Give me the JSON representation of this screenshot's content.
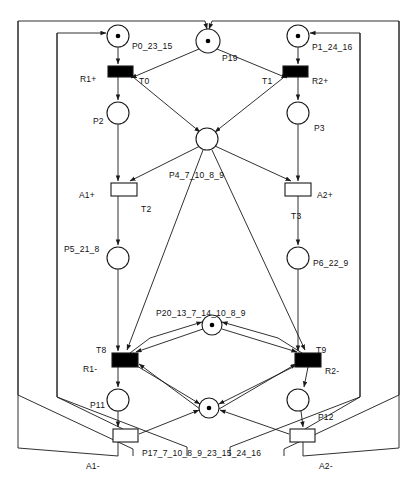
{
  "diagram": {
    "type": "petri-net",
    "canvas": {
      "width": 416,
      "height": 481
    },
    "colors": {
      "stroke": "#1a1a1a",
      "background": "#ffffff",
      "transition_enabled_fill": "#000000",
      "transition_disabled_fill": "#ffffff",
      "token_fill": "#000000"
    }
  },
  "places": [
    {
      "id": "P0",
      "label": "P0_23_15",
      "cx": 118,
      "cy": 36,
      "r": 11,
      "tokens": 1,
      "label_x": 132,
      "label_y": 41
    },
    {
      "id": "P19",
      "label": "P19",
      "cx": 208,
      "cy": 41,
      "r": 12,
      "tokens": 1,
      "label_x": 222,
      "label_y": 53
    },
    {
      "id": "P1",
      "label": "P1_24_16",
      "cx": 298,
      "cy": 36,
      "r": 11,
      "tokens": 1,
      "label_x": 312,
      "label_y": 42
    },
    {
      "id": "P2",
      "label": "P2",
      "cx": 118,
      "cy": 113,
      "r": 11,
      "tokens": 0,
      "label_x": 93,
      "label_y": 116
    },
    {
      "id": "P3",
      "label": "P3",
      "cx": 298,
      "cy": 113,
      "r": 11,
      "tokens": 0,
      "label_x": 314,
      "label_y": 123
    },
    {
      "id": "P4",
      "label": "P4_7_10_8_9",
      "cx": 207,
      "cy": 139,
      "r": 11,
      "tokens": 0,
      "label_x": 169,
      "label_y": 170
    },
    {
      "id": "P5",
      "label": "P5_21_8",
      "cx": 118,
      "cy": 258,
      "r": 11,
      "tokens": 0,
      "label_x": 64,
      "label_y": 244
    },
    {
      "id": "P6",
      "label": "P6_22_9",
      "cx": 298,
      "cy": 258,
      "r": 11,
      "tokens": 0,
      "label_x": 313,
      "label_y": 258
    },
    {
      "id": "P20",
      "label": "P20_13_7_14_10_8_9",
      "cx": 212,
      "cy": 325,
      "r": 10,
      "tokens": 1,
      "label_x": 156,
      "label_y": 308
    },
    {
      "id": "P11",
      "label": "P11",
      "cx": 118,
      "cy": 400,
      "r": 11,
      "tokens": 0,
      "label_x": 90,
      "label_y": 400
    },
    {
      "id": "P12",
      "label": "P12",
      "cx": 298,
      "cy": 400,
      "r": 11,
      "tokens": 0,
      "label_x": 318,
      "label_y": 412
    },
    {
      "id": "P17",
      "label": "P17_7_10_8_9_23_15_24_16",
      "cx": 209,
      "cy": 408,
      "r": 10,
      "tokens": 1,
      "label_x": 142,
      "label_y": 448
    }
  ],
  "transitions": [
    {
      "id": "T0",
      "name_label": "T0",
      "action_label": "R1+",
      "x": 108,
      "y": 66,
      "w": 25,
      "h": 11,
      "filled": true,
      "name_x": 139,
      "name_y": 76,
      "action_x": 80,
      "action_y": 74
    },
    {
      "id": "T1",
      "name_label": "T1",
      "action_label": "R2+",
      "x": 283,
      "y": 66,
      "w": 25,
      "h": 11,
      "filled": true,
      "name_x": 262,
      "name_y": 76,
      "action_x": 312,
      "action_y": 76
    },
    {
      "id": "T2",
      "name_label": "T2",
      "action_label": "A1+",
      "x": 111,
      "y": 183,
      "w": 26,
      "h": 13,
      "filled": false,
      "name_x": 141,
      "name_y": 204,
      "action_x": 79,
      "action_y": 190
    },
    {
      "id": "T3",
      "name_label": "T3",
      "action_label": "A2+",
      "x": 285,
      "y": 183,
      "w": 26,
      "h": 13,
      "filled": false,
      "name_x": 291,
      "name_y": 211,
      "action_x": 317,
      "action_y": 190
    },
    {
      "id": "T8",
      "name_label": "T8",
      "action_label": "R1-",
      "x": 112,
      "y": 353,
      "w": 26,
      "h": 14,
      "filled": true,
      "name_x": 96,
      "name_y": 345,
      "action_x": 83,
      "action_y": 364
    },
    {
      "id": "T9",
      "name_label": "T9",
      "action_label": "R2-",
      "x": 295,
      "y": 353,
      "w": 26,
      "h": 14,
      "filled": true,
      "name_x": 316,
      "name_y": 345,
      "action_x": 325,
      "action_y": 366
    },
    {
      "id": "TA1m",
      "name_label": "A1-",
      "action_label": "",
      "x": 113,
      "y": 429,
      "w": 25,
      "h": 13,
      "filled": false,
      "name_x": 86,
      "name_y": 461,
      "action_x": 0,
      "action_y": 0
    },
    {
      "id": "TA2m",
      "name_label": "A2-",
      "action_label": "",
      "x": 290,
      "y": 429,
      "w": 25,
      "h": 13,
      "filled": false,
      "name_x": 319,
      "name_y": 461,
      "action_x": 0,
      "action_y": 0
    }
  ],
  "arcs": [
    {
      "from": "P0",
      "to": "T0",
      "path": "M118,47 L118,64"
    },
    {
      "from": "T0",
      "to": "P2",
      "path": "M118,77 L118,100"
    },
    {
      "from": "P2",
      "to": "T2",
      "path": "M118,124 L118,181"
    },
    {
      "from": "T2",
      "to": "P5",
      "path": "M118,196 L118,245"
    },
    {
      "from": "P5",
      "to": "T8",
      "path": "M118,269 L118,351"
    },
    {
      "from": "T8",
      "to": "P11",
      "path": "M118,367 L118,387"
    },
    {
      "from": "P11",
      "to": "TA1m",
      "path": "M118,411 L118,427"
    },
    {
      "from": "P1",
      "to": "T1",
      "path": "M298,47 L298,64"
    },
    {
      "from": "T1",
      "to": "P3",
      "path": "M298,77 L298,100"
    },
    {
      "from": "P3",
      "to": "T3",
      "path": "M298,124 L298,181"
    },
    {
      "from": "T3",
      "to": "P6",
      "path": "M298,196 L298,245"
    },
    {
      "from": "P6",
      "to": "T9",
      "path": "M298,269 L298,351"
    },
    {
      "from": "T9",
      "to": "P12",
      "path": "M308,367 L304,387"
    },
    {
      "from": "P12",
      "to": "TA2m",
      "path": "M301,411 L303,427"
    },
    {
      "from": "P19",
      "to": "T0",
      "path": "M199,49 L131,78"
    },
    {
      "from": "P19",
      "to": "T1",
      "path": "M217,49 L287,78"
    },
    {
      "from": "T0",
      "to": "P4",
      "path": "M133,77 L200,132"
    },
    {
      "from": "T1",
      "to": "P4",
      "path": "M283,78 L215,132"
    },
    {
      "from": "P4",
      "to": "T2",
      "path": "M200,146 L130,181"
    },
    {
      "from": "P4",
      "to": "T3",
      "path": "M215,146 L291,181"
    },
    {
      "from": "P4",
      "to": "T8",
      "path": "M203,150 L127,350"
    },
    {
      "from": "P4",
      "to": "T9",
      "path": "M212,150 L305,350"
    },
    {
      "from": "P20",
      "to": "T8",
      "path": "M203,329 L136,352"
    },
    {
      "from": "P20",
      "to": "T9",
      "path": "M222,329 L297,352"
    },
    {
      "from": "T8",
      "to": "P20",
      "path": "M130,353 L150,338 L202,322"
    },
    {
      "from": "T9",
      "to": "P20",
      "path": "M302,353 L278,338 L222,322"
    },
    {
      "from": "T8",
      "to": "P17",
      "path": "M137,366 L200,404"
    },
    {
      "from": "P17",
      "to": "T8",
      "path": "M200,409 L139,364"
    },
    {
      "from": "T9",
      "to": "P17",
      "path": "M295,366 L219,404"
    },
    {
      "from": "P17",
      "to": "T9",
      "path": "M219,409 L296,364"
    },
    {
      "from": "TA1m",
      "to": "P17",
      "path": "M139,434 L199,410"
    },
    {
      "from": "TA2m",
      "to": "P17",
      "path": "M289,434 L220,410"
    },
    {
      "from": "TA1m",
      "to": "P0",
      "path": "M118,442 L118,456 L18,448 L18,21 L205,21 L207,29"
    },
    {
      "from": "TA1m",
      "to": "P19",
      "path": "M123,429 L57,397 L57,33 L106,33"
    },
    {
      "from": "TA2m",
      "to": "P1",
      "path": "M303,442 L303,456 L399,448 L399,21 L212,21 L209,29"
    },
    {
      "from": "TA2m",
      "to": "P19",
      "path": "M305,429 L360,397 L360,33 L310,33"
    }
  ],
  "boundary_loops": {
    "left_outer": "M18,21 L18,395 L133,449 L133,456",
    "left_inner": "M57,33 L57,397 L187,447 L187,456",
    "right_outer": "M399,21 L399,395 L284,449 L284,456",
    "right_inner": "M360,33 L360,397 L230,447 L230,456"
  }
}
